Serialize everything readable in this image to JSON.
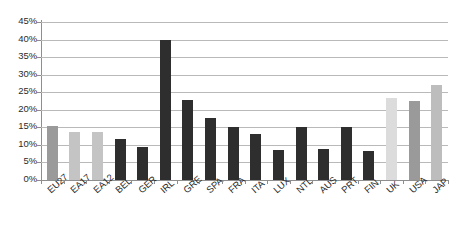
{
  "chart_data": {
    "type": "bar",
    "title": "",
    "subtitle": "",
    "xlabel": "",
    "ylabel": "",
    "ylim": [
      0,
      45
    ],
    "ytick_labels": [
      "0%",
      "5%",
      "10%",
      "15%",
      "20%",
      "25%",
      "30%",
      "35%",
      "40%",
      "45%"
    ],
    "ytick_values": [
      0,
      5,
      10,
      15,
      20,
      25,
      30,
      35,
      40,
      45
    ],
    "grid": true,
    "legend": "none",
    "value_suffix": "%",
    "categories": [
      "EU27",
      "EA17",
      "EA12",
      "BEL",
      "GER",
      "IRL",
      "GRE",
      "SPA",
      "FRA",
      "ITA",
      "LUX",
      "NTL",
      "AUS",
      "PRT",
      "FIN",
      "UK",
      "USA",
      "JAP"
    ],
    "values": [
      15.5,
      13.7,
      13.8,
      11.8,
      9.4,
      40.0,
      22.7,
      17.8,
      15.0,
      13.1,
      8.6,
      15.1,
      8.9,
      15.1,
      8.3,
      23.4,
      22.6,
      27.0
    ],
    "bar_colors": [
      "#9a9a9a",
      "#c4c4c4",
      "#c4c4c4",
      "#2e2e2e",
      "#2e2e2e",
      "#2e2e2e",
      "#2e2e2e",
      "#2e2e2e",
      "#2e2e2e",
      "#2e2e2e",
      "#2e2e2e",
      "#2e2e2e",
      "#2e2e2e",
      "#2e2e2e",
      "#2e2e2e",
      "#dcdcdc",
      "#9a9a9a",
      "#bdbdbd"
    ],
    "colors": {
      "aggregate_light": "#c4c4c4",
      "aggregate_medium": "#9a9a9a",
      "country_dark": "#2e2e2e",
      "external_pale": "#dcdcdc",
      "external_mid": "#bdbdbd",
      "gridline": "#b9b9b9",
      "axis": "#8e8e8e",
      "text": "#2b2b2b",
      "background": "#ffffff"
    }
  }
}
